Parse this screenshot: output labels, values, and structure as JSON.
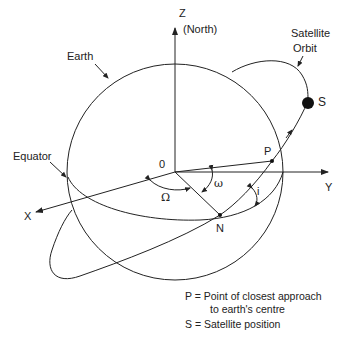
{
  "labels": {
    "z_axis": "Z",
    "north": "(North)",
    "y_axis": "Y",
    "x_axis": "X",
    "origin": "0",
    "earth": "Earth",
    "equator": "Equator",
    "satellite_orbit_line1": "Satellite",
    "satellite_orbit_line2": "Orbit",
    "satellite": "S",
    "perigee": "P",
    "node": "N",
    "raan": "Ω",
    "arg_perigee": "ω",
    "inclination": "i"
  },
  "legend": {
    "p_line1": "P = Point of closest approach",
    "p_line2": "to earth's centre",
    "s_line": "S = Satellite position"
  },
  "colors": {
    "stroke": "#222222",
    "background": "#ffffff"
  }
}
